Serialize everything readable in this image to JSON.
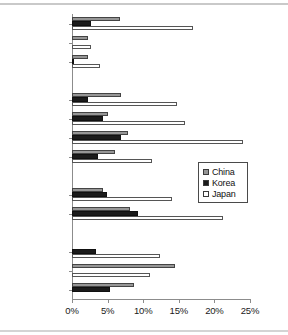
{
  "chart_data": {
    "type": "bar",
    "orientation": "horizontal",
    "title": "",
    "subtitle": "",
    "xlabel": "",
    "ylabel": "",
    "xlim": [
      0,
      25
    ],
    "xunit": "%",
    "grid": false,
    "legend_position": "center-right",
    "xticks": [
      "0%",
      "5%",
      "10%",
      "15%",
      "20%",
      "25%"
    ],
    "xtick_values": [
      0,
      5,
      10,
      15,
      20,
      25
    ],
    "categories": [
      "Vietnam",
      "Laos",
      "Cambodia",
      "Thailand",
      "Philippines",
      "Indonesia",
      "Malaysia",
      "NZ",
      "Australia",
      "China",
      "Korea",
      "Japan"
    ],
    "groups": [
      {
        "gap_after": true,
        "members": [
          "Vietnam",
          "Laos",
          "Cambodia"
        ]
      },
      {
        "gap_after": true,
        "members": [
          "Thailand",
          "Philippines",
          "Indonesia",
          "Malaysia"
        ]
      },
      {
        "gap_after": true,
        "members": [
          "NZ",
          "Australia"
        ]
      },
      {
        "gap_after": false,
        "members": [
          "China",
          "Korea",
          "Japan"
        ]
      }
    ],
    "series": [
      {
        "name": "China",
        "color": "#969696",
        "values": [
          6.8,
          2.3,
          2.2,
          6.9,
          5.1,
          7.8,
          6.0,
          4.3,
          8.2,
          0.0,
          14.4,
          8.7
        ]
      },
      {
        "name": "Korea",
        "color": "#1b1b1b",
        "values": [
          2.6,
          0.0,
          0.2,
          2.3,
          4.3,
          6.9,
          3.6,
          4.9,
          9.2,
          3.4,
          0.0,
          5.4
        ]
      },
      {
        "name": "Japan",
        "color": "#ffffff",
        "values": [
          17.0,
          2.6,
          3.9,
          14.7,
          15.9,
          24.0,
          11.2,
          14.0,
          21.2,
          12.3,
          10.9,
          0.0
        ]
      }
    ]
  },
  "legend": {
    "items": [
      {
        "label": "China",
        "key": "china"
      },
      {
        "label": "Korea",
        "key": "korea"
      },
      {
        "label": "Japan",
        "key": "japan"
      }
    ]
  }
}
